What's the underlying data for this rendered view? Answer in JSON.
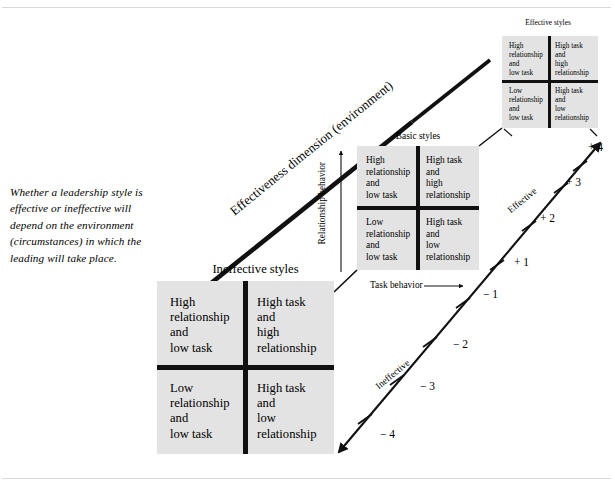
{
  "caption": "Whether a leadership style is effective or ineffective will depend on the environment (circumstances) in which the leading will take place.",
  "labels": {
    "effectiveness_dimension": "Effectiveness dimension (environment)",
    "task_behavior": "Task behavior",
    "relationship_behavior": "Relationship behavior",
    "effective": "Effective",
    "ineffective": "Ineffective"
  },
  "grids": {
    "ineffective": {
      "title": "Ineffective styles",
      "cells": {
        "top_left": "High\nrelationship\nand\nlow task",
        "top_right": "High task\nand\nhigh\nrelationship",
        "bottom_left": "Low\nrelationship\nand\nlow task",
        "bottom_right": "High task\nand\nlow\nrelationship"
      }
    },
    "basic": {
      "title": "Basic styles",
      "cells": {
        "top_left": "High\nrelationship\nand\nlow task",
        "top_right": "High task\nand\nhigh\nrelationship",
        "bottom_left": "Low\nrelationship\nand\nlow task",
        "bottom_right": "High task\nand\nlow\nrelationship"
      }
    },
    "effective": {
      "title": "Effective styles",
      "cells": {
        "top_left": "High\nrelationship\nand\nlow task",
        "top_right": "High task\nand\nhigh\nrelationship",
        "bottom_left": "Low\nrelationship\nand\nlow task",
        "bottom_right": "High task\nand\nlow\nrelationship"
      }
    }
  },
  "scale": {
    "plus4": "+ 4",
    "plus3": "+ 3",
    "plus2": "+ 2",
    "plus1": "+ 1",
    "minus1": "− 1",
    "minus2": "− 2",
    "minus3": "− 3",
    "minus4": "− 4"
  },
  "colors": {
    "grid_fill": "#e3e3e3",
    "ink": "#111111",
    "frame": "#d9d9d9",
    "page": "#ffffff"
  }
}
